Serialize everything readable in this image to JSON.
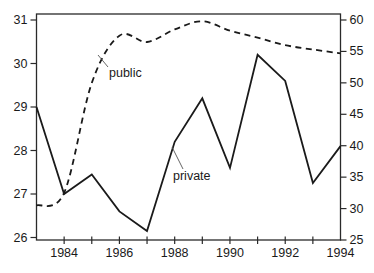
{
  "chart_data": {
    "type": "line",
    "title": "",
    "x": [
      1983,
      1984,
      1985,
      1986,
      1987,
      1988,
      1989,
      1990,
      1991,
      1992,
      1993,
      1994
    ],
    "series": [
      {
        "name": "public",
        "axis": "right",
        "line_style": "dashed",
        "values": [
          30.5,
          32.5,
          50.0,
          57.5,
          56.5,
          58.5,
          59.8,
          58.3,
          57.2,
          56.0,
          55.3,
          54.7
        ]
      },
      {
        "name": "private",
        "axis": "left",
        "line_style": "solid",
        "values": [
          29.0,
          27.0,
          27.45,
          26.6,
          26.15,
          28.2,
          29.2,
          27.6,
          30.2,
          29.6,
          27.25,
          28.1
        ]
      }
    ],
    "left_axis": {
      "min": 26,
      "max": 31,
      "ticks": [
        "26",
        "27",
        "28",
        "29",
        "30",
        "31"
      ]
    },
    "right_axis": {
      "min": 25,
      "max": 60,
      "ticks": [
        "25",
        "30",
        "35",
        "40",
        "45",
        "50",
        "55",
        "60"
      ]
    },
    "x_axis": {
      "tick_years": [
        1984,
        1985,
        1986,
        1987,
        1988,
        1989,
        1990,
        1991,
        1992,
        1993
      ],
      "labeled_years": [
        1984,
        1986,
        1988,
        1990,
        1992,
        1994
      ],
      "labels": [
        "1984",
        "1986",
        "1988",
        "1990",
        "1992",
        "1994"
      ]
    },
    "annotations": [
      {
        "text": "public",
        "label_xy": [
          109,
          77
        ],
        "leader": [
          [
            98,
            55
          ],
          [
            108,
            67
          ]
        ]
      },
      {
        "text": "private",
        "label_xy": [
          173,
          180
        ],
        "leader": [
          [
            172,
            147
          ],
          [
            183,
            169
          ]
        ]
      }
    ],
    "grid": false,
    "legend_position": "inline-annotations",
    "colors": {
      "line": "#1a1a1a",
      "text": "#1a1a1a",
      "frame": "#2a2a2a"
    }
  }
}
